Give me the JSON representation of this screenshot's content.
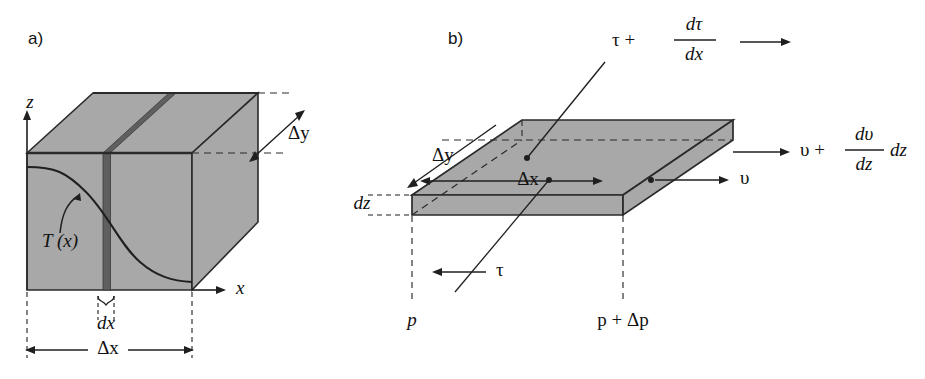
{
  "figure": {
    "background_color": "#ffffff",
    "ink_color": "#1a1a1a",
    "body_fill_color": "#a8a8a8",
    "slab_fill_color": "#6e6e6e",
    "edge_color": "#2a2a2a"
  },
  "panel_a": {
    "letter": "a)",
    "axis_z": "z",
    "axis_x": "x",
    "curve_label": "T (x)",
    "curve_label_T": "T",
    "curve_label_arg": "(x)",
    "depth_label": "Δy",
    "slab_label": "dx",
    "width_label": "Δx",
    "icons": {
      "z_axis": "arrow-up-icon",
      "x_axis": "arrow-right-icon",
      "depth_arrow": "double-arrow-diagonal-icon",
      "dx_brace": "curly-brace-icon",
      "width_dimension": "double-arrow-horizontal-icon",
      "curve_pointer": "curved-arrow-icon"
    }
  },
  "panel_b": {
    "letter": "b)",
    "shear_top_base": "τ +",
    "shear_top_num": "dτ",
    "shear_top_den": "dx",
    "shear_bottom": "τ",
    "velocity_top_base": "υ +",
    "velocity_top_num": "dυ",
    "velocity_top_den": "dz",
    "velocity_top_suffix": "dz",
    "velocity_bottom": "υ",
    "depth_label": "Δy",
    "width_label": "Δx",
    "thickness_label": "dz",
    "pressure_left": "p",
    "pressure_right": "p + Δp",
    "icons": {
      "shear_top_arrow": "arrow-right-icon",
      "shear_bottom_arrow": "arrow-left-icon",
      "velocity_top_arrow": "arrow-right-icon",
      "velocity_bottom_arrow": "arrow-right-icon",
      "depth_arrow": "arrow-left-diagonal-icon",
      "width_arrow": "double-arrow-horizontal-icon",
      "thickness_ticks": "dashed-tick-icon",
      "pressure_left_line": "dashed-vertical-icon",
      "pressure_right_line": "dashed-vertical-icon",
      "leader_shear_top": "leader-line-icon",
      "leader_shear_bottom": "leader-line-icon"
    }
  }
}
